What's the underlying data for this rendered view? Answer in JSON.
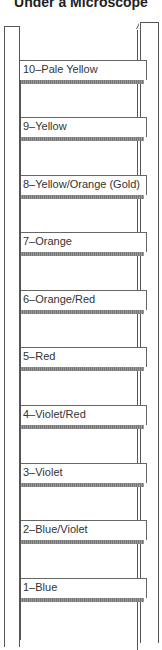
{
  "title": "Under a Microscope",
  "rungs": [
    {
      "label": "10–Pale Yellow",
      "top": 60
    },
    {
      "label": "9–Yellow",
      "top": 117
    },
    {
      "label": "8–Yellow/Orange (Gold)",
      "top": 175
    },
    {
      "label": "7–Orange",
      "top": 232
    },
    {
      "label": "6–Orange/Red",
      "top": 290
    },
    {
      "label": "5–Red",
      "top": 347
    },
    {
      "label": "4–Violet/Red",
      "top": 405
    },
    {
      "label": "3–Violet",
      "top": 463
    },
    {
      "label": "2–Blue/Violet",
      "top": 520
    },
    {
      "label": "1–Blue",
      "top": 578
    }
  ]
}
